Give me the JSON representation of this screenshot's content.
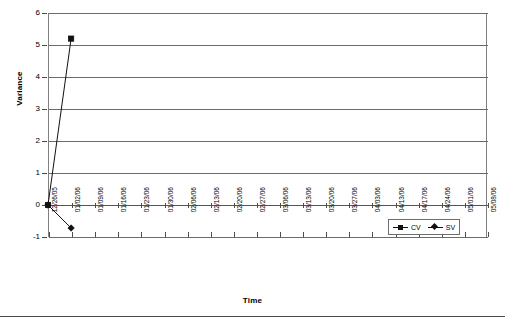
{
  "chart_data": {
    "type": "line",
    "title": "",
    "xlabel": "Time",
    "ylabel": "Variance",
    "ylim": [
      -1,
      6
    ],
    "yticks": [
      6,
      5,
      4,
      3,
      2,
      1,
      0,
      -1
    ],
    "ytick_labels": [
      "6",
      "5",
      "4",
      "3",
      "2",
      "1",
      "0",
      "-1"
    ],
    "grid": true,
    "legend_position": "inside-bottom-right",
    "categories": [
      "12/26/05",
      "01/02/06",
      "01/09/06",
      "01/16/06",
      "01/23/06",
      "01/30/06",
      "02/06/06",
      "02/13/06",
      "02/20/06",
      "02/27/06",
      "03/06/06",
      "03/13/06",
      "03/20/06",
      "03/27/06",
      "04/03/06",
      "04/13/06",
      "04/17/06",
      "04/24/06",
      "05/01/06",
      "05/08/06"
    ],
    "series": [
      {
        "name": "CV",
        "marker": "square",
        "color": "#111111",
        "values": [
          0,
          5.2,
          null,
          null,
          null,
          null,
          null,
          null,
          null,
          null,
          null,
          null,
          null,
          null,
          null,
          null,
          null,
          null,
          null,
          null
        ]
      },
      {
        "name": "SV",
        "marker": "diamond",
        "color": "#111111",
        "values": [
          0,
          -0.72,
          null,
          null,
          null,
          null,
          null,
          null,
          null,
          null,
          null,
          null,
          null,
          null,
          null,
          null,
          null,
          null,
          null,
          null
        ]
      }
    ]
  },
  "legend": {
    "entries": [
      {
        "label": "CV",
        "marker": "square-marker-icon"
      },
      {
        "label": "SV",
        "marker": "diamond-marker-icon"
      }
    ]
  }
}
